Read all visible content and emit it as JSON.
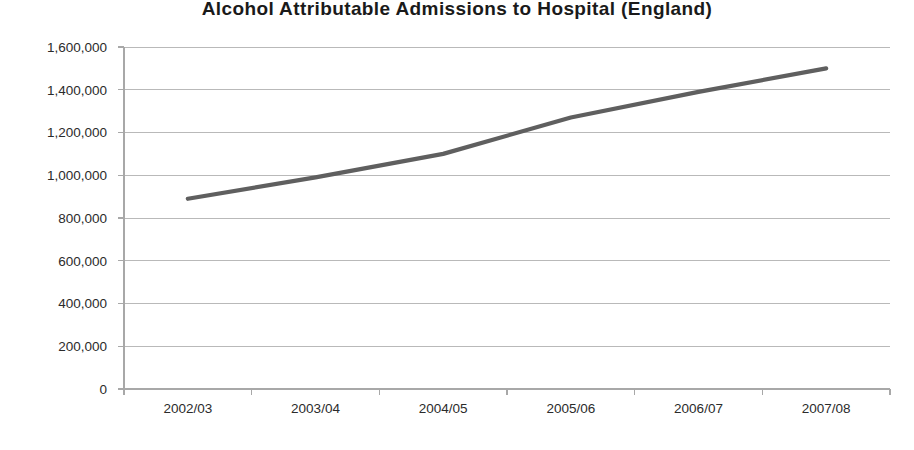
{
  "chart_data": {
    "type": "line",
    "title": "Alcohol Attributable Admissions to Hospital (England)",
    "xlabel": "",
    "ylabel": "",
    "categories": [
      "2002/03",
      "2003/04",
      "2004/05",
      "2005/06",
      "2006/07",
      "2007/08"
    ],
    "series": [
      {
        "name": "Alcohol attributable admissions",
        "values": [
          890000,
          990000,
          1100000,
          1270000,
          1390000,
          1500000
        ]
      }
    ],
    "ylim": [
      0,
      1600000
    ],
    "ytick_values": [
      0,
      200000,
      400000,
      600000,
      800000,
      1000000,
      1200000,
      1400000,
      1600000
    ],
    "ytick_labels": [
      "0",
      "200,000",
      "400,000",
      "600,000",
      "800,000",
      "1,000,000",
      "1,200,000",
      "1,400,000",
      "1,600,000"
    ],
    "grid": true,
    "grid_axis": "y",
    "legend": false,
    "legend_position": "none",
    "annotations": [],
    "colors": {
      "series_line": "#5f5f5f",
      "gridline": "#b9b9b9",
      "axis": "#a8a8a8",
      "title_text": "#1a1a1a",
      "tick_text": "#2b2b2b",
      "background": "#ffffff"
    }
  },
  "layout": {
    "plot_left": 124,
    "plot_right": 890,
    "plot_top": 47,
    "plot_bottom": 389,
    "tick_length": 6,
    "ytick_label_gap": 11,
    "xtick_label_offset": 24
  }
}
